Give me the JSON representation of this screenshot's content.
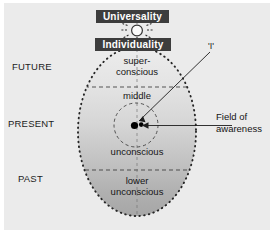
{
  "diagram": {
    "title_boxes": {
      "universality": "Universality",
      "individuality": "Individuality"
    },
    "time_axis": {
      "future": "FUTURE",
      "present": "PRESENT",
      "past": "PAST"
    },
    "psyche_levels": {
      "superconscious_line1": "super-",
      "superconscious_line2": "conscious",
      "middle": "middle",
      "unconscious": "unconscious",
      "lower_line1": "lower",
      "lower_line2": "unconscious"
    },
    "callouts": {
      "self": "'I'",
      "field_line1": "Field of",
      "field_line2": "awareness"
    },
    "colors": {
      "canvas": "#ebebeb",
      "box_fill": "#3d3d3d",
      "box_text": "#ffffff",
      "outline": "#2a2a2a",
      "egg_top": "#e8e8e8",
      "egg_bottom": "#a9a9a9",
      "center_dot": "#000000"
    },
    "icons": {
      "starburst": "sun-starburst-icon"
    }
  }
}
